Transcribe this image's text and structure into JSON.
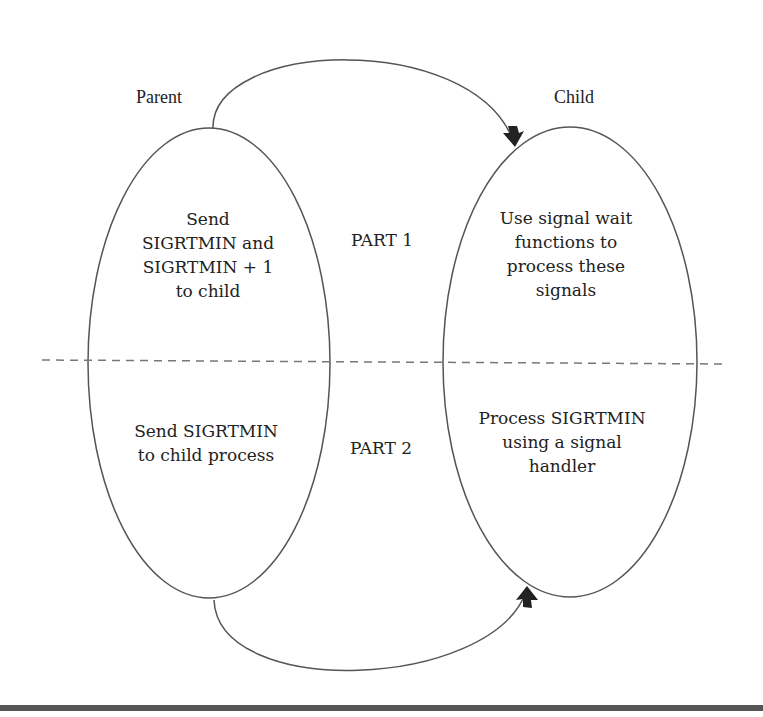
{
  "diagram": {
    "labels": {
      "parent": "Parent",
      "child": "Child",
      "part1": "PART 1",
      "part2": "PART 2"
    },
    "parent_node": {
      "part1_text": "Send\nSIGRTMIN and\nSIGRTMIN + 1\nto child",
      "part2_text": "Send SIGRTMIN\nto child process"
    },
    "child_node": {
      "part1_text": "Use signal wait\nfunctions to\nprocess these\nsignals",
      "part2_text": "Process SIGRTMIN\nusing a signal\nhandler"
    },
    "edges": [
      {
        "from": "Parent",
        "to": "Child",
        "section": "PART 1",
        "style": "curved arrow over top"
      },
      {
        "from": "Parent",
        "to": "Child",
        "section": "PART 2",
        "style": "curved arrow under bottom"
      }
    ],
    "colors": {
      "stroke": "#555555",
      "text": "#222222",
      "arrowhead": "#222222",
      "dashed_divider": "#777777",
      "bottom_rule": "#555555"
    }
  }
}
